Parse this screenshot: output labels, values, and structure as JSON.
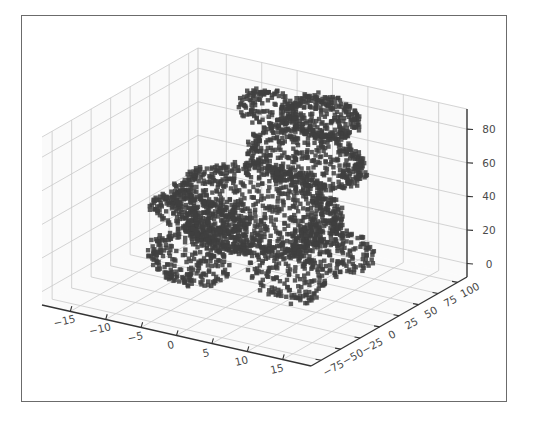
{
  "figure": {
    "width": 535,
    "height": 423,
    "background_color": "#ffffff",
    "border_color": "#6b6b6b",
    "title": ""
  },
  "chart_data": {
    "type": "scatter",
    "projection": "3d",
    "title": "",
    "subtitle": "",
    "xlabel": "",
    "ylabel": "",
    "zlabel": "",
    "grid": true,
    "legend": null,
    "legend_position": "none",
    "marker": {
      "shape": "square",
      "size_px": 2.2,
      "color": "#3f3f3f",
      "opacity": 0.85
    },
    "pane_color": "#fafafa",
    "grid_color": "#c9c9c9",
    "axis_line_color": "#333333",
    "view": {
      "elev": 18,
      "azim": -58
    },
    "xlim": [
      -19,
      19
    ],
    "ylim": [
      -88,
      112
    ],
    "zlim": [
      -8,
      92
    ],
    "xticks": [
      -15,
      -10,
      -5,
      0,
      5,
      10,
      15
    ],
    "yticks": [
      -75,
      -50,
      -25,
      0,
      25,
      50,
      75,
      100
    ],
    "zticks": [
      0,
      20,
      40,
      60,
      80
    ],
    "xtick_labels": [
      "−15",
      "−10",
      "−5",
      "0",
      "5",
      "10",
      "15"
    ],
    "ytick_labels": [
      "−75",
      "−50",
      "−25",
      "0",
      "25",
      "50",
      "75",
      "100"
    ],
    "ztick_labels": [
      "0",
      "20",
      "40",
      "60",
      "80"
    ],
    "point_count": 2800,
    "dataset_description": "Stanford bunny point cloud",
    "annotations": []
  }
}
